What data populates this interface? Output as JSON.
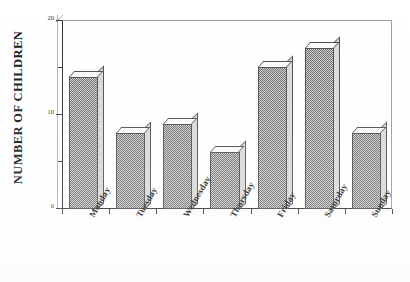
{
  "chart_data": {
    "type": "bar",
    "title": "",
    "subtitle": "",
    "xlabel": "",
    "ylabel": "NUMBER OF CHILDREN",
    "categories": [
      "Monday",
      "Tuesday",
      "Wednesday",
      "Thursday",
      "Friday",
      "Saturday",
      "Sunday"
    ],
    "values": [
      14,
      8,
      9,
      6,
      15,
      17,
      8
    ],
    "ylim": [
      0,
      20
    ],
    "ytick_labels": [
      "0",
      "10",
      "20"
    ],
    "ytick_values": [
      0,
      10,
      20
    ],
    "yminor_tick_values": [
      5,
      15
    ],
    "grid": false,
    "legend": null,
    "legend_position": "none",
    "style": "3d-extruded-bars",
    "bar_fill_color": "#8f8f8f",
    "bar_top_color": "#fbfbfb",
    "bar_side_color": "#d8d8d8",
    "bar_edge_color": "#4a4a4a",
    "axis_color": "#2a2a2a",
    "background_color": "#ffffff"
  },
  "axis": {
    "y_title": "NUMBER OF CHILDREN",
    "y_labels": {
      "top": "20",
      "middle": "10",
      "bottom": "0"
    }
  }
}
